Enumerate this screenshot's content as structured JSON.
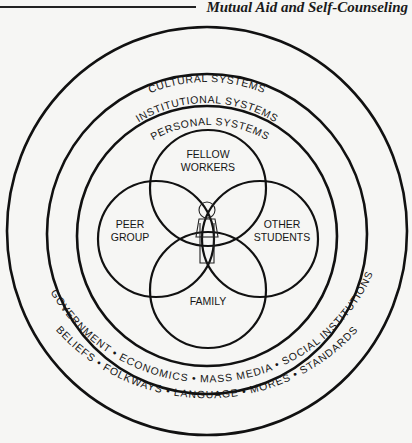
{
  "header": {
    "title": "Mutual Aid and Self-Counseling"
  },
  "diagram": {
    "rings": {
      "cultural": {
        "label": "CULTURAL SYSTEMS",
        "items_text": "BELIEFS • FOLKWAYS • LANGUAGE • MORES • STANDARDS",
        "items": [
          "BELIEFS",
          "FOLKWAYS",
          "LANGUAGE",
          "MORES",
          "STANDARDS"
        ]
      },
      "institutional": {
        "label": "INSTITUTIONAL SYSTEMS",
        "items_text": "GOVERNMENT • ECONOMICS • MASS MEDIA • SOCIAL INSTITUTIONS",
        "items": [
          "GOVERNMENT",
          "ECONOMICS",
          "MASS MEDIA",
          "SOCIAL INSTITUTIONS"
        ]
      },
      "personal": {
        "label": "PERSONAL SYSTEMS"
      }
    },
    "petals": {
      "top": {
        "line1": "FELLOW",
        "line2": "WORKERS"
      },
      "left": {
        "line1": "PEER",
        "line2": "GROUP"
      },
      "right": {
        "line1": "OTHER",
        "line2": "STUDENTS"
      },
      "bottom": {
        "line1": "FAMILY"
      }
    },
    "center_icon": "person-figure-icon"
  }
}
